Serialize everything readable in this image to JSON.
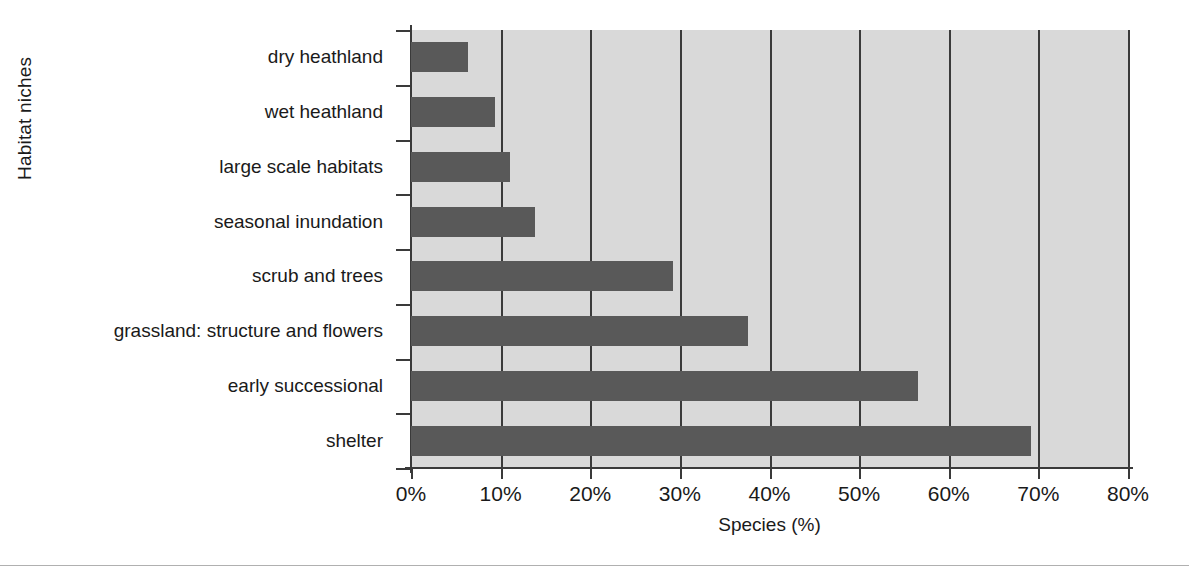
{
  "chart_data": {
    "type": "bar",
    "orientation": "horizontal",
    "title": "",
    "xlabel": "Species (%)",
    "ylabel": "Habitat niches",
    "xlim": [
      0,
      80
    ],
    "xticks": [
      0,
      10,
      20,
      30,
      40,
      50,
      60,
      70,
      80
    ],
    "xticklabels": [
      "0%",
      "10%",
      "20%",
      "30%",
      "40%",
      "50%",
      "60%",
      "70%",
      "80%"
    ],
    "grid": "vertical",
    "legend": "none",
    "plot_background": "#d9d9d9",
    "bar_color": "#595959",
    "axis_color": "#3a3a3a",
    "categories": [
      "dry heathland",
      "wet heathland",
      "large scale habitats",
      "seasonal inundation",
      "scrub and trees",
      "grassland: structure and flowers",
      "early successional",
      "shelter"
    ],
    "values": [
      6.4,
      9.4,
      11.0,
      13.8,
      29.2,
      37.6,
      56.6,
      69.2
    ]
  }
}
